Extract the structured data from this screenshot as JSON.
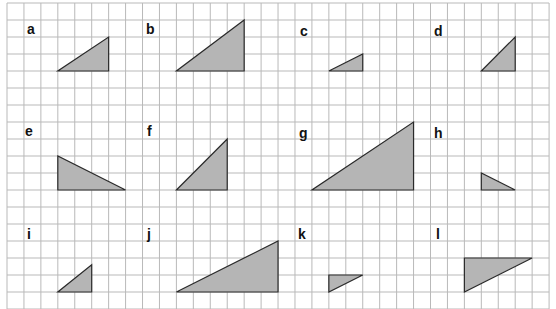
{
  "grid": {
    "origin_x": 7,
    "origin_y": 3,
    "cell_w": 16.94,
    "cell_h": 17,
    "cols": 32,
    "rows": 18,
    "line_color": "#b9b9b9",
    "border_color": "#9a9a9a"
  },
  "style": {
    "fill": "#b5b5b5",
    "stroke": "#2a2a2a"
  },
  "triangles": [
    {
      "label": "a",
      "label_pos": [
        27,
        22
      ],
      "points": [
        [
          3,
          4
        ],
        [
          6,
          4
        ],
        [
          6,
          2
        ]
      ]
    },
    {
      "label": "b",
      "label_pos": [
        146,
        22
      ],
      "points": [
        [
          10,
          4
        ],
        [
          14,
          4
        ],
        [
          14,
          1
        ]
      ]
    },
    {
      "label": "c",
      "label_pos": [
        300,
        24
      ],
      "points": [
        [
          19,
          4
        ],
        [
          21,
          4
        ],
        [
          21,
          3
        ]
      ]
    },
    {
      "label": "d",
      "label_pos": [
        434,
        24
      ],
      "points": [
        [
          28,
          4
        ],
        [
          30,
          4
        ],
        [
          30,
          2
        ]
      ]
    },
    {
      "label": "e",
      "label_pos": [
        25,
        124
      ],
      "points": [
        [
          3,
          9
        ],
        [
          3,
          11
        ],
        [
          7,
          11
        ]
      ]
    },
    {
      "label": "f",
      "label_pos": [
        147,
        124
      ],
      "points": [
        [
          10,
          11
        ],
        [
          13,
          11
        ],
        [
          13,
          8
        ]
      ]
    },
    {
      "label": "g",
      "label_pos": [
        299,
        126
      ],
      "points": [
        [
          18,
          11
        ],
        [
          24,
          11
        ],
        [
          24,
          7
        ]
      ]
    },
    {
      "label": "h",
      "label_pos": [
        434,
        126
      ],
      "points": [
        [
          28,
          10
        ],
        [
          28,
          11
        ],
        [
          30,
          11
        ]
      ]
    },
    {
      "label": "i",
      "label_pos": [
        27,
        227
      ],
      "points": [
        [
          3,
          17
        ],
        [
          5,
          17
        ],
        [
          5,
          15.4
        ]
      ]
    },
    {
      "label": "j",
      "label_pos": [
        147,
        227
      ],
      "points": [
        [
          10,
          17
        ],
        [
          16,
          17
        ],
        [
          16,
          14
        ]
      ]
    },
    {
      "label": "k",
      "label_pos": [
        298,
        227
      ],
      "points": [
        [
          19,
          16
        ],
        [
          21,
          16
        ],
        [
          19,
          17
        ]
      ]
    },
    {
      "label": "l",
      "label_pos": [
        436,
        227
      ],
      "points": [
        [
          27,
          15
        ],
        [
          31,
          15
        ],
        [
          27,
          17
        ]
      ]
    }
  ]
}
